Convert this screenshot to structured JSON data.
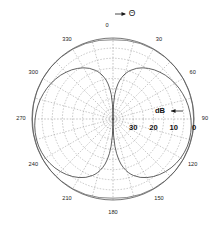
{
  "figure": {
    "type": "polar-antenna-pattern",
    "angle_unit_symbol": "Θ",
    "radial_unit": "dB"
  },
  "chart_data": {
    "type": "line",
    "plot_kind": "polar",
    "title": "",
    "xlabel": "",
    "ylabel": "",
    "angle_label": "Θ",
    "radial_label": "dB",
    "grid": true,
    "legend": "none",
    "angle_direction": "clockwise",
    "angle_zero_location": "top",
    "angle_tick_labels": [
      "0",
      "30",
      "60",
      "90",
      "120",
      "150",
      "180",
      "210",
      "240",
      "270",
      "300",
      "330"
    ],
    "angle_ticks": [
      0,
      30,
      60,
      90,
      120,
      150,
      180,
      210,
      240,
      270,
      300,
      330
    ],
    "radial_tick_labels": [
      "30",
      "20",
      "10",
      "0"
    ],
    "radial_ticks": [
      -30,
      -20,
      -10,
      0
    ],
    "rlim": [
      -40,
      0
    ],
    "radial_grid_rings": [
      -35,
      -30,
      -25,
      -20,
      -15,
      -10,
      -5,
      0
    ],
    "series": [
      {
        "name": "pattern",
        "theta": [
          0,
          2,
          4,
          6,
          8,
          10,
          12,
          14,
          16,
          18,
          20,
          25,
          30,
          35,
          40,
          45,
          50,
          55,
          60,
          65,
          70,
          75,
          80,
          85,
          90,
          95,
          100,
          105,
          110,
          115,
          120,
          125,
          130,
          135,
          140,
          145,
          150,
          155,
          160,
          162,
          164,
          166,
          168,
          170,
          172,
          174,
          176,
          178,
          180,
          182,
          184,
          186,
          188,
          190,
          192,
          194,
          196,
          198,
          200,
          205,
          210,
          215,
          220,
          225,
          230,
          235,
          240,
          245,
          250,
          255,
          260,
          265,
          270,
          275,
          280,
          285,
          290,
          295,
          300,
          305,
          310,
          315,
          320,
          325,
          330,
          335,
          340,
          342,
          344,
          346,
          348,
          350,
          352,
          354,
          356,
          358,
          360
        ],
        "values_db": [
          -40,
          -33,
          -28,
          -25,
          -22.5,
          -20.5,
          -19,
          -17.6,
          -16.4,
          -15.3,
          -14.4,
          -12.4,
          -10.8,
          -9.5,
          -8.3,
          -7.3,
          -6.3,
          -5.5,
          -4.7,
          -4.0,
          -3.4,
          -2.8,
          -2.3,
          -1.9,
          -1.5,
          -1.2,
          -1.0,
          -0.9,
          -0.9,
          -1.1,
          -1.4,
          -1.9,
          -2.5,
          -3.3,
          -4.2,
          -5.3,
          -6.6,
          -8.2,
          -10.3,
          -11.3,
          -12.5,
          -13.9,
          -15.5,
          -17.4,
          -19.8,
          -22.8,
          -26.5,
          -32,
          -40,
          -32,
          -26.5,
          -22.8,
          -19.8,
          -17.4,
          -15.5,
          -13.9,
          -12.5,
          -11.3,
          -10.3,
          -8.2,
          -6.6,
          -5.3,
          -4.2,
          -3.3,
          -2.5,
          -1.9,
          -1.4,
          -1.1,
          -0.9,
          -0.9,
          -1.0,
          -1.2,
          -1.5,
          -1.9,
          -2.3,
          -2.8,
          -3.4,
          -4.0,
          -4.7,
          -5.5,
          -6.3,
          -7.3,
          -8.3,
          -9.5,
          -10.8,
          -12.4,
          -14.4,
          -15.3,
          -16.4,
          -17.6,
          -19,
          -20.5,
          -22.5,
          -25,
          -28,
          -33,
          -40
        ]
      },
      {
        "name": "envelope",
        "theta": [
          0,
          10,
          20,
          30,
          40,
          50,
          60,
          70,
          80,
          90,
          100,
          110,
          120,
          130,
          140,
          150,
          160,
          170,
          180,
          190,
          200,
          210,
          220,
          230,
          240,
          250,
          260,
          270,
          280,
          290,
          300,
          310,
          320,
          330,
          340,
          350,
          360
        ],
        "values_db": [
          -0.9,
          -0.6,
          -0.35,
          -0.2,
          -0.1,
          -0.04,
          0,
          -0.04,
          -0.1,
          -0.15,
          -0.1,
          -0.04,
          0,
          -0.04,
          -0.1,
          -0.2,
          -0.35,
          -0.6,
          -0.9,
          -0.6,
          -0.35,
          -0.2,
          -0.1,
          -0.04,
          0,
          -0.04,
          -0.1,
          -0.15,
          -0.1,
          -0.04,
          0,
          -0.04,
          -0.1,
          -0.2,
          -0.35,
          -0.6,
          -0.9
        ]
      }
    ],
    "annotations": [
      {
        "text": "dB",
        "position": "right-of-center-above-axis"
      },
      {
        "text": "Θ",
        "position": "top-right-of-zero-label"
      }
    ]
  },
  "labels": {
    "angles": [
      {
        "text": "0",
        "deg": 0
      },
      {
        "text": "30",
        "deg": 30
      },
      {
        "text": "60",
        "deg": 60
      },
      {
        "text": "90",
        "deg": 90
      },
      {
        "text": "120",
        "deg": 120
      },
      {
        "text": "150",
        "deg": 150
      },
      {
        "text": "180",
        "deg": 180
      },
      {
        "text": "210",
        "deg": 210
      },
      {
        "text": "240",
        "deg": 240
      },
      {
        "text": "270",
        "deg": 270
      },
      {
        "text": "300",
        "deg": 300
      },
      {
        "text": "330",
        "deg": 330
      }
    ],
    "rings": [
      {
        "text": "30"
      },
      {
        "text": "20"
      },
      {
        "text": "10"
      },
      {
        "text": "0"
      }
    ],
    "db": "dB",
    "theta": "Θ"
  }
}
